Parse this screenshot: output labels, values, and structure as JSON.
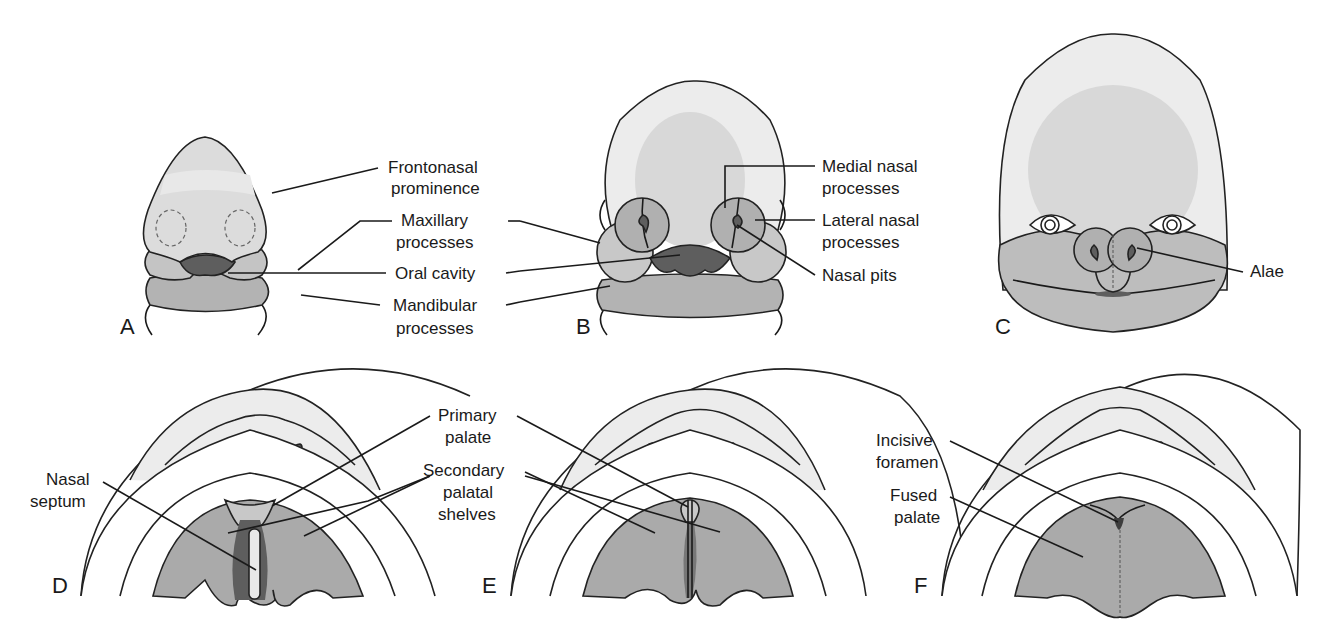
{
  "figure": {
    "colors": {
      "skin_light": "#ececec",
      "face_mid": "#c8c8c8",
      "face_dark": "#b0b0b0",
      "cavity": "#5e5e5e",
      "palate": "#aaaaaa",
      "background": "#ffffff"
    },
    "panels": [
      {
        "letter": "A",
        "labels": [
          "Frontonasal",
          "prominence",
          "Maxillary",
          "processes",
          "Oral cavity",
          "Mandibular",
          "processes"
        ]
      },
      {
        "letter": "B",
        "labels": [
          "Medial nasal",
          "processes",
          "Lateral nasal",
          "processes",
          "Nasal pits"
        ]
      },
      {
        "letter": "C",
        "labels": [
          "Alae"
        ]
      },
      {
        "letter": "D",
        "labels": [
          "Nasal",
          "septum"
        ]
      },
      {
        "letter": "E",
        "labels": [
          "Primary",
          "palate",
          "Secondary",
          "palatal",
          "shelves"
        ]
      },
      {
        "letter": "F",
        "labels": [
          "Incisive",
          "foramen",
          "Fused",
          "palate"
        ]
      }
    ]
  }
}
